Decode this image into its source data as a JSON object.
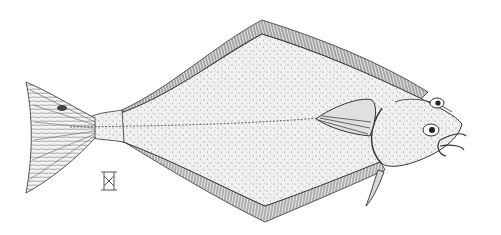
{
  "image": {
    "subject": "Halibut (flatfish) pen-and-ink stipple illustration",
    "description": "Eyed side of a right-facing flatfish with fringed dorsal and anal fins, forked caudal fin on the left, pectoral fin behind the head, and a small monogram mark beneath the tail",
    "colors": {
      "background": "#ffffff",
      "ink": "#2a2a2a",
      "stipple": "#6a6a6a",
      "light_body": "#ececec"
    },
    "monogram": "artist monogram mark"
  }
}
